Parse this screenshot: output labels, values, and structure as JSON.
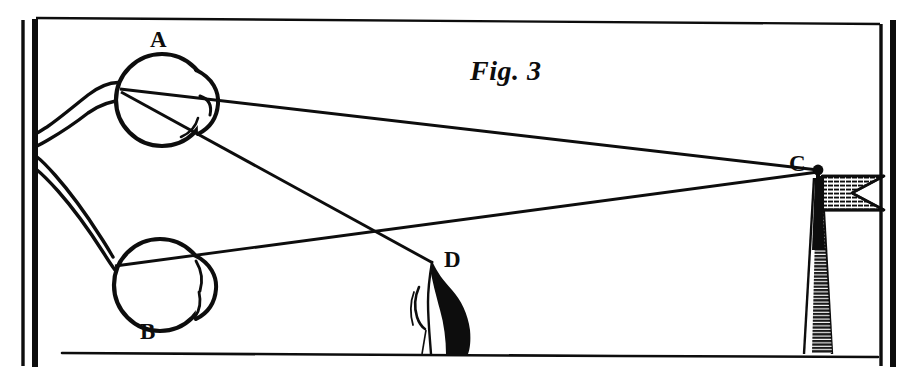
{
  "figure": {
    "caption": "Fig. 3",
    "background_color": "#ffffff",
    "ink_color": "#0d0d0d"
  },
  "labels": {
    "eye_upper": "A",
    "eye_lower": "B",
    "far_object": "C",
    "near_object": "D"
  },
  "elements": {
    "frame": {
      "name": "plate-border",
      "left_rule_outer_x": 22,
      "left_rule_inner_x": 36,
      "right_rule_inner_x": 880,
      "right_rule_outer_x": 894,
      "top_rule_y": 18,
      "ground_line_y": 355
    },
    "eye_upper": {
      "name": "eye-A",
      "center_x": 162,
      "center_y": 100,
      "radius": 46,
      "cornea_side": "right"
    },
    "eye_lower": {
      "name": "eye-B",
      "center_x": 160,
      "center_y": 285,
      "radius": 46,
      "cornea_side": "right"
    },
    "flagpole": {
      "name": "flagpole-C",
      "top_x": 818,
      "top_y": 170,
      "base_x": 818,
      "base_y": 355,
      "flag_width": 62,
      "flag_height": 34,
      "flag_type": "swallowtail-pennant",
      "finial": "ball"
    },
    "near_object": {
      "name": "object-D",
      "apex_x": 432,
      "apex_y": 262,
      "base_y": 355
    }
  },
  "rays": [
    {
      "name": "ray-A-to-C",
      "from": "A",
      "to": "C"
    },
    {
      "name": "ray-A-to-D",
      "from": "A",
      "to": "D"
    },
    {
      "name": "ray-B-to-C",
      "from": "B",
      "to": "C"
    },
    {
      "name": "ray-B-to-D",
      "from": "B",
      "to": "D"
    }
  ],
  "optic_nerves": [
    {
      "name": "optic-nerve-A",
      "from": "A",
      "to": "left-rule"
    },
    {
      "name": "optic-nerve-B",
      "from": "B",
      "to": "left-rule"
    }
  ]
}
